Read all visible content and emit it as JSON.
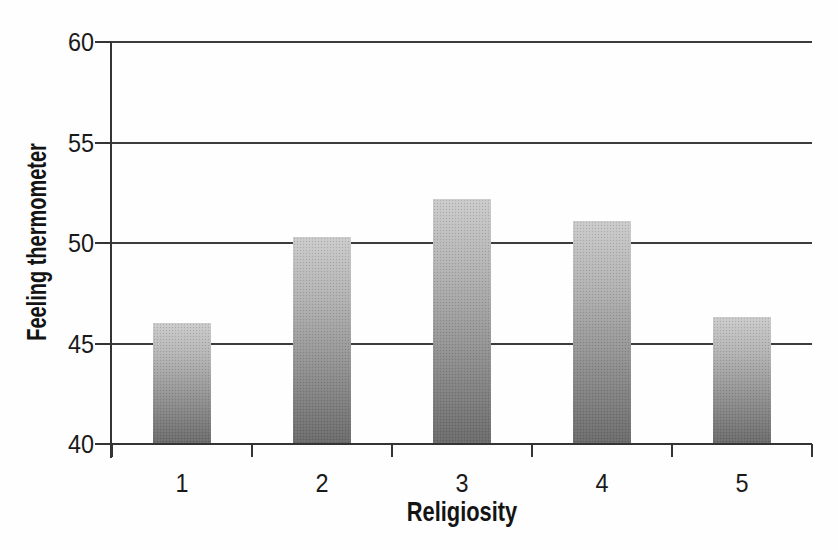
{
  "chart_data": {
    "type": "bar",
    "categories": [
      "1",
      "2",
      "3",
      "4",
      "5"
    ],
    "values": [
      46.0,
      50.3,
      52.2,
      51.1,
      46.3
    ],
    "title": "",
    "xlabel": "Religiosity",
    "ylabel": "Feeling thermometer",
    "ylim": [
      40,
      60
    ],
    "yticks": [
      40,
      45,
      50,
      55,
      60
    ],
    "grid": true,
    "legend": "none",
    "bar_gradient_top": "#cbcbcb",
    "bar_gradient_bottom": "#6b6b6b",
    "line_color": "#343434"
  }
}
